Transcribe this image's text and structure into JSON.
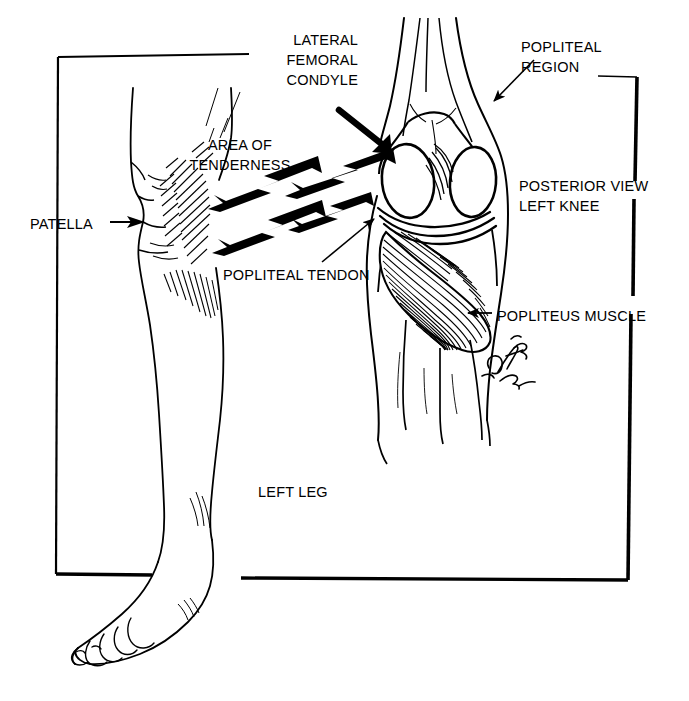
{
  "figure": {
    "signature": "D. Ross '92",
    "ink_color": "#000000",
    "background_color": "#ffffff"
  },
  "labels": {
    "lateral_femoral_condyle": "LATERAL\nFEMORAL\nCONDYLE",
    "popliteal_region": "POPLITEAL\nREGION",
    "area_of_tenderness": "AREA OF\nTENDERNESS",
    "patella": "PATELLA",
    "posterior_view_left_knee": "POSTERIOR VIEW\nLEFT KNEE",
    "popliteal_tendon": "POPLITEAL TENDON",
    "popliteus_muscle": "POPLITEUS MUSCLE",
    "left_leg": "LEFT LEG"
  },
  "annotations": {
    "pain_arrows_count": 4,
    "pointer_arrows": [
      "lateral-femoral-condyle-pointer",
      "popliteal-region-pointer",
      "patella-pointer",
      "popliteal-tendon-pointer",
      "popliteus-muscle-pointer"
    ]
  },
  "anatomy_parts": [
    "left-leg-profile",
    "foot",
    "patella",
    "posterior-knee",
    "medial-femoral-condyle",
    "lateral-femoral-condyle",
    "popliteus-muscle",
    "popliteal-tendon",
    "tibia",
    "fibula"
  ]
}
